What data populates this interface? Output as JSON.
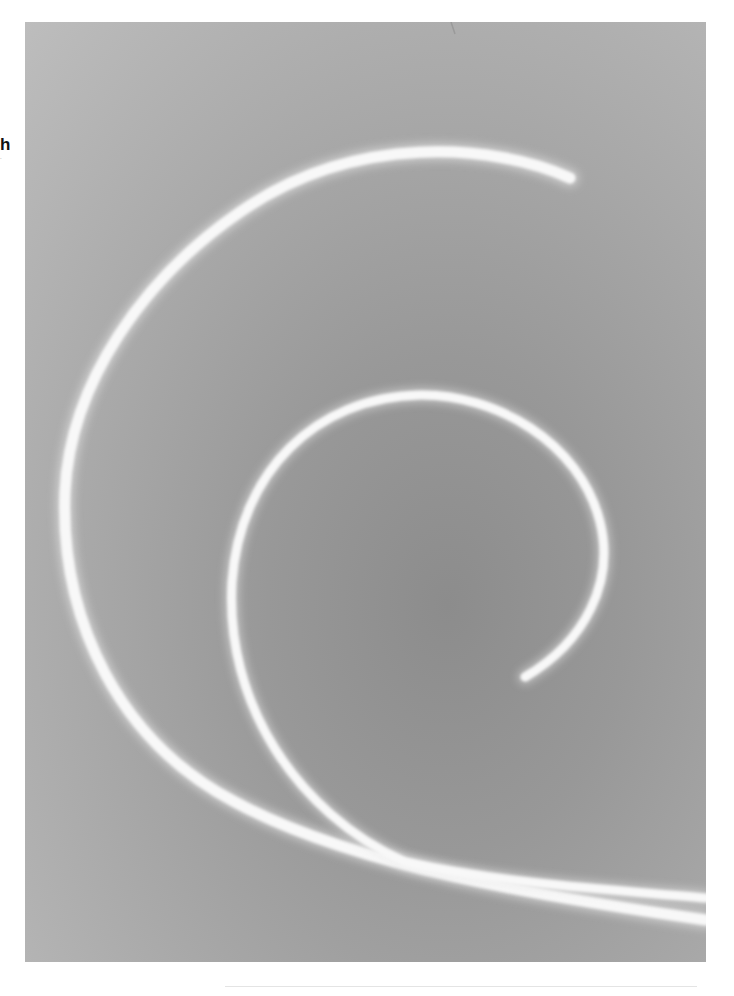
{
  "page": {
    "margin_text": {
      "letter": "h",
      "small": "."
    }
  },
  "photo": {
    "description": "Grayscale photograph of two bright white curved spiral trails on a mottled gray background",
    "colors": {
      "background_light": "#bdbdbd",
      "background_dark": "#8c8c8c",
      "trail": "#f7f7f7"
    },
    "trails": [
      {
        "name": "outer-spiral-trail",
        "path": "M 545 156 C 470 122, 330 110, 215 190 C 120 255, 45 360, 40 470 C 35 600, 95 720, 210 780 C 330 845, 520 875, 681 898"
      },
      {
        "name": "inner-spiral-trail",
        "path": "M 500 655 C 560 620, 590 560, 575 500 C 555 420, 470 372, 395 373 C 290 375, 215 450, 207 560 C 200 680, 270 790, 380 840 C 480 862, 590 868, 681 876"
      }
    ]
  }
}
